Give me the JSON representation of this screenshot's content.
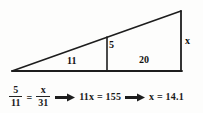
{
  "figure": {
    "type": "geometry-diagram",
    "shape": "right-triangle-with-internal-vertical-segment",
    "labels": {
      "base_left_segment": "11",
      "base_right_segment": "20",
      "inner_height": "5",
      "outer_height": "x"
    }
  },
  "equation": {
    "fraction_left": {
      "numerator": "5",
      "denominator": "11"
    },
    "equals": "=",
    "fraction_right": {
      "numerator": "x",
      "denominator": "31"
    },
    "arrow1": "→",
    "step1": "11x = 155",
    "arrow2": "→",
    "step2": "x = 14.1"
  },
  "colors": {
    "ink": "#1a1a1a",
    "line": "#222222",
    "paper": "#fdfdfc"
  }
}
